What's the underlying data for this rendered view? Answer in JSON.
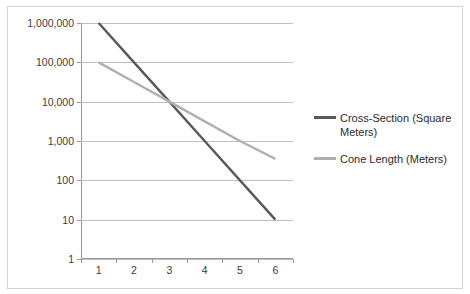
{
  "chart_data": {
    "type": "line",
    "title": "",
    "xlabel": "",
    "ylabel": "",
    "x": [
      1,
      2,
      3,
      4,
      5,
      6
    ],
    "categories": [
      "1",
      "2",
      "3",
      "4",
      "5",
      "6"
    ],
    "y_scale": "log",
    "ylim": [
      1,
      1000000
    ],
    "y_ticks": [
      1,
      10,
      100,
      1000,
      10000,
      100000,
      1000000
    ],
    "y_tick_labels": [
      "1",
      "10",
      "100",
      "1,000",
      "10,000",
      "100,000",
      "1,000,000"
    ],
    "x_tick_labels": [
      "1",
      "2",
      "3",
      "4",
      "5",
      "6"
    ],
    "grid": "horizontal",
    "legend_position": "right",
    "series": [
      {
        "name": "Cross-Section (Square Meters)",
        "color": "#595959",
        "values": [
          1000000,
          100000,
          10000,
          1000,
          100,
          10
        ]
      },
      {
        "name": "Cone Length (Meters)",
        "color": "#b0b0b0",
        "values": [
          100000,
          31600,
          10000,
          3160,
          1000,
          350
        ]
      }
    ]
  },
  "legend": {
    "entries": [
      {
        "label": "Cross-Section (Square Meters)",
        "color": "#595959"
      },
      {
        "label": "Cone Length (Meters)",
        "color": "#b0b0b0"
      }
    ]
  },
  "axes": {
    "y_labels": [
      "1,000,000",
      "100,000",
      "10,000",
      "1,000",
      "100",
      "10",
      "1"
    ],
    "x_labels": [
      "1",
      "2",
      "3",
      "4",
      "5",
      "6"
    ]
  },
  "colors": {
    "grid": "#bfbfbf",
    "axis": "#9a9a9a",
    "border": "#d4d4d4",
    "text": "#3b3b3b",
    "background": "#ffffff"
  }
}
